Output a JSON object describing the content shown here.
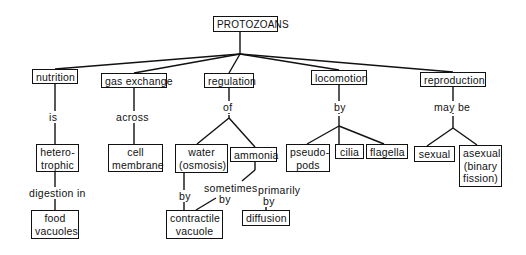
{
  "diagram": {
    "title": "PROTOZOANS",
    "nodes": [
      {
        "id": "protozoans",
        "text": "PROTOZOANS",
        "x": 213,
        "y": 16,
        "w": 65,
        "h": 16
      },
      {
        "id": "nutrition",
        "text": "nutrition",
        "x": 32,
        "y": 69,
        "w": 46,
        "h": 15
      },
      {
        "id": "gas-exchange",
        "text": "gas exchange",
        "x": 101,
        "y": 73,
        "w": 66,
        "h": 15
      },
      {
        "id": "regulation",
        "text": "regulation",
        "x": 204,
        "y": 73,
        "w": 50,
        "h": 15
      },
      {
        "id": "locomotion",
        "text": "locomotion",
        "x": 311,
        "y": 70,
        "w": 56,
        "h": 15
      },
      {
        "id": "reproduction",
        "text": "reproduction",
        "x": 420,
        "y": 72,
        "w": 66,
        "h": 15
      },
      {
        "id": "heterotrophic",
        "text": "hetero-\ntrophic",
        "x": 36,
        "y": 144,
        "w": 43,
        "h": 28
      },
      {
        "id": "cell-membrane",
        "text": "cell\nmembrane",
        "x": 108,
        "y": 144,
        "w": 55,
        "h": 28
      },
      {
        "id": "water",
        "text": "water\n(osmosis)",
        "x": 175,
        "y": 144,
        "w": 53,
        "h": 29
      },
      {
        "id": "ammonia",
        "text": "ammonia",
        "x": 230,
        "y": 147,
        "w": 47,
        "h": 15
      },
      {
        "id": "pseudopods",
        "text": "pseudo-\npods",
        "x": 286,
        "y": 144,
        "w": 44,
        "h": 28
      },
      {
        "id": "cilia",
        "text": "cilia",
        "x": 335,
        "y": 144,
        "w": 29,
        "h": 15
      },
      {
        "id": "flagella",
        "text": "flagella",
        "x": 366,
        "y": 144,
        "w": 42,
        "h": 15
      },
      {
        "id": "sexual",
        "text": "sexual",
        "x": 414,
        "y": 146,
        "w": 41,
        "h": 16
      },
      {
        "id": "asexual",
        "text": "asexual\n(binary\nfission)",
        "x": 459,
        "y": 145,
        "w": 43,
        "h": 42
      },
      {
        "id": "food-vacuoles",
        "text": "food\nvacuoles",
        "x": 31,
        "y": 210,
        "w": 48,
        "h": 29
      },
      {
        "id": "contractile-vacuole",
        "text": "contractile\nvacuole",
        "x": 166,
        "y": 210,
        "w": 57,
        "h": 29
      },
      {
        "id": "diffusion",
        "text": "diffusion",
        "x": 242,
        "y": 210,
        "w": 48,
        "h": 16
      }
    ],
    "labels": [
      {
        "id": "is",
        "text": "is",
        "x": 48,
        "y": 111
      },
      {
        "id": "across",
        "text": "across",
        "x": 115,
        "y": 111
      },
      {
        "id": "of",
        "text": "of",
        "x": 222,
        "y": 101
      },
      {
        "id": "by-loco",
        "text": "by",
        "x": 333,
        "y": 101
      },
      {
        "id": "may-be",
        "text": "may be",
        "x": 433,
        "y": 101
      },
      {
        "id": "digestion-in",
        "text": "digestion in",
        "x": 28,
        "y": 187
      },
      {
        "id": "sometimes",
        "text": "sometimes",
        "x": 203,
        "y": 182
      },
      {
        "id": "primarily",
        "text": "primarily",
        "x": 257,
        "y": 184
      },
      {
        "id": "by-water",
        "text": "by",
        "x": 178,
        "y": 190
      },
      {
        "id": "by-sometimes",
        "text": "by",
        "x": 218,
        "y": 193
      },
      {
        "id": "by-primarily",
        "text": "by",
        "x": 262,
        "y": 195
      }
    ],
    "edges": [
      [
        240,
        32,
        240,
        54
      ],
      [
        240,
        54,
        55,
        69
      ],
      [
        240,
        54,
        134,
        73
      ],
      [
        240,
        54,
        229,
        73
      ],
      [
        240,
        54,
        339,
        70
      ],
      [
        240,
        54,
        453,
        72
      ],
      [
        55,
        84,
        55,
        144
      ],
      [
        134,
        88,
        134,
        144
      ],
      [
        229,
        88,
        229,
        114
      ],
      [
        229,
        115,
        229,
        118
      ],
      [
        229,
        118,
        197,
        144
      ],
      [
        229,
        118,
        255,
        147
      ],
      [
        339,
        85,
        339,
        114
      ],
      [
        339,
        116,
        339,
        126
      ],
      [
        339,
        126,
        307,
        144
      ],
      [
        339,
        126,
        339,
        144
      ],
      [
        339,
        126,
        384,
        144
      ],
      [
        453,
        87,
        453,
        114
      ],
      [
        453,
        116,
        453,
        128
      ],
      [
        453,
        128,
        427,
        146
      ],
      [
        453,
        128,
        477,
        145
      ],
      [
        55,
        172,
        55,
        210
      ],
      [
        184,
        173,
        184,
        210
      ],
      [
        196,
        210,
        216,
        198
      ],
      [
        255,
        162,
        255,
        170
      ],
      [
        255,
        170,
        242,
        181
      ],
      [
        266,
        206,
        266,
        210
      ]
    ]
  }
}
